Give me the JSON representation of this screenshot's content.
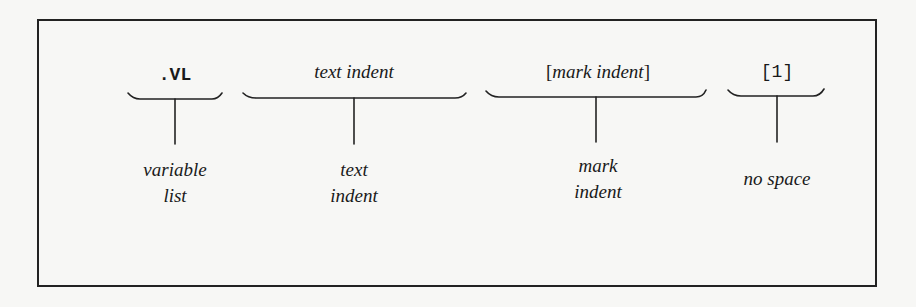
{
  "diagram": {
    "segments": [
      {
        "id": "vl",
        "top_label": ".VL",
        "top_style": "mono-bold",
        "bottom_lines": [
          "variable",
          "list"
        ]
      },
      {
        "id": "text-indent",
        "top_label": "text indent",
        "top_style": "italic",
        "bottom_lines": [
          "text",
          "indent"
        ]
      },
      {
        "id": "mark-indent",
        "top_label_open": "[",
        "top_label": "mark indent",
        "top_label_close": "]",
        "top_style": "italic-bracketed",
        "bottom_lines": [
          "mark",
          "indent"
        ]
      },
      {
        "id": "no-space",
        "top_label": "[1]",
        "top_style": "mono",
        "bottom_lines": [
          "no space"
        ]
      }
    ]
  }
}
